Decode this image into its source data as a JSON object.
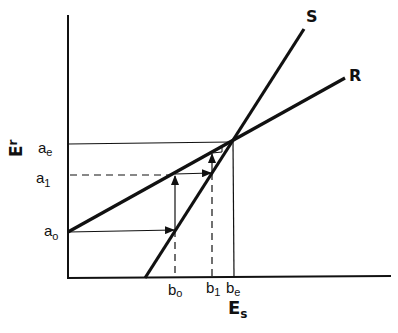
{
  "diagram": {
    "type": "cobweb-convergence",
    "axes": {
      "x_label_main": "E",
      "x_label_sub": "s",
      "y_label_main": "E",
      "y_label_sub": "r"
    },
    "lines": [
      {
        "name": "S",
        "label": "S",
        "from": [
          145,
          278
        ],
        "to": [
          304,
          29
        ]
      },
      {
        "name": "R",
        "label": "R",
        "from": [
          68,
          232
        ],
        "to": [
          345,
          78
        ]
      }
    ],
    "y_ticks": [
      {
        "id": "a_e",
        "main": "a",
        "sub": "e",
        "y": 144
      },
      {
        "id": "a_1",
        "main": "a",
        "sub": "1",
        "y": 175
      },
      {
        "id": "a_0",
        "main": "a",
        "sub": "o",
        "y": 232
      }
    ],
    "x_ticks": [
      {
        "id": "b_0",
        "main": "b",
        "sub": "o",
        "x": 175
      },
      {
        "id": "b_1",
        "main": "b",
        "sub": "1",
        "x": 212
      },
      {
        "id": "b_e",
        "main": "b",
        "sub": "e",
        "x": 234
      }
    ],
    "equilibrium": {
      "x": 231,
      "y": 142
    },
    "colors": {
      "ink": "#111111",
      "background": "#ffffff"
    }
  }
}
